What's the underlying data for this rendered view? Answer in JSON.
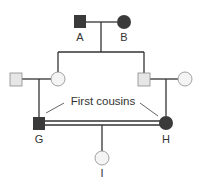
{
  "diagram": {
    "type": "pedigree",
    "colors": {
      "affected": "#3a3a3a",
      "unaffected_male_fill": "#e6e6e6",
      "unaffected_female_fill": "#f4f4f4",
      "line": "#333333",
      "outline": "#8a8a8a"
    },
    "individuals": [
      {
        "id": "A",
        "label": "A",
        "sex": "male",
        "affected": true,
        "generation": 1
      },
      {
        "id": "B",
        "label": "B",
        "sex": "female",
        "affected": true,
        "generation": 1
      },
      {
        "id": "II-1",
        "label": "",
        "sex": "male",
        "affected": false,
        "generation": 2
      },
      {
        "id": "II-2",
        "label": "",
        "sex": "female",
        "affected": false,
        "generation": 2
      },
      {
        "id": "II-3",
        "label": "",
        "sex": "male",
        "affected": false,
        "generation": 2
      },
      {
        "id": "II-4",
        "label": "",
        "sex": "female",
        "affected": false,
        "generation": 2
      },
      {
        "id": "G",
        "label": "G",
        "sex": "male",
        "affected": true,
        "generation": 3
      },
      {
        "id": "H",
        "label": "H",
        "sex": "female",
        "affected": true,
        "generation": 3
      },
      {
        "id": "I",
        "label": "I",
        "sex": "female",
        "affected": false,
        "generation": 4
      }
    ],
    "annotation": "First cousins",
    "consanguineous_mating": [
      "G",
      "H"
    ]
  }
}
